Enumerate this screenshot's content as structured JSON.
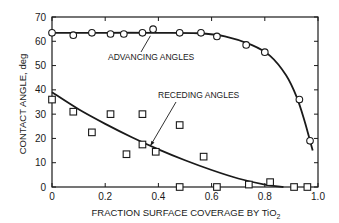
{
  "chart_data": {
    "type": "scatter",
    "title": "",
    "xlabel": "FRACTION SURFACE COVERAGE BY TiO",
    "xlabel_subscript": "2",
    "ylabel": "CONTACT ANGLE, deg",
    "xlim": [
      0,
      1.0
    ],
    "ylim": [
      0,
      70
    ],
    "x_ticks": [
      "0",
      "0.2",
      "0.4",
      "0.6",
      "0.8",
      "1.0"
    ],
    "y_ticks": [
      "0",
      "10",
      "20",
      "30",
      "40",
      "50",
      "60",
      "70"
    ],
    "grid": false,
    "series": [
      {
        "name": "ADVANCING ANGLES",
        "marker": "circle",
        "points": [
          [
            0.0,
            63.5
          ],
          [
            0.08,
            62.5
          ],
          [
            0.15,
            63.5
          ],
          [
            0.22,
            63
          ],
          [
            0.27,
            63
          ],
          [
            0.34,
            63.5
          ],
          [
            0.38,
            65
          ],
          [
            0.48,
            63.5
          ],
          [
            0.56,
            63.5
          ],
          [
            0.62,
            62
          ],
          [
            0.73,
            58.5
          ],
          [
            0.8,
            55.5
          ],
          [
            0.93,
            36
          ],
          [
            0.97,
            19
          ]
        ],
        "curve": [
          [
            0.0,
            63.5
          ],
          [
            0.2,
            63.5
          ],
          [
            0.4,
            63.5
          ],
          [
            0.55,
            63.3
          ],
          [
            0.65,
            62
          ],
          [
            0.75,
            58.5
          ],
          [
            0.82,
            54
          ],
          [
            0.88,
            46
          ],
          [
            0.92,
            37
          ],
          [
            0.95,
            27
          ],
          [
            0.97,
            19
          ],
          [
            0.98,
            15
          ]
        ]
      },
      {
        "name": "RECEDING ANGLES",
        "marker": "square",
        "points": [
          [
            0.0,
            36
          ],
          [
            0.08,
            31
          ],
          [
            0.15,
            22.5
          ],
          [
            0.22,
            30
          ],
          [
            0.28,
            13.5
          ],
          [
            0.34,
            30
          ],
          [
            0.34,
            17.5
          ],
          [
            0.39,
            14.5
          ],
          [
            0.48,
            25.5
          ],
          [
            0.57,
            12.5
          ],
          [
            0.48,
            0
          ],
          [
            0.62,
            0
          ],
          [
            0.74,
            1
          ],
          [
            0.82,
            2
          ],
          [
            0.91,
            0
          ],
          [
            0.96,
            0
          ]
        ],
        "curve": [
          [
            0.0,
            39
          ],
          [
            0.1,
            32
          ],
          [
            0.2,
            26
          ],
          [
            0.3,
            20.5
          ],
          [
            0.4,
            15.5
          ],
          [
            0.5,
            11
          ],
          [
            0.6,
            7
          ],
          [
            0.7,
            3.5
          ],
          [
            0.8,
            1
          ],
          [
            0.87,
            0
          ]
        ]
      }
    ],
    "annotations": [
      {
        "text": "ADVANCING ANGLES",
        "arrow_to": [
          0.37,
          63.5
        ]
      },
      {
        "text": "RECEDING ANGLES",
        "arrow_to": [
          0.37,
          17
        ]
      }
    ]
  }
}
